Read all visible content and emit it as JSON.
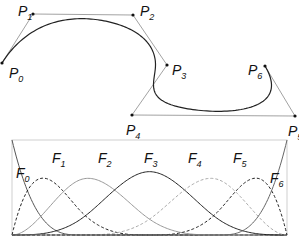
{
  "control_points": [
    {
      "name": "P",
      "index": "0",
      "x": 2,
      "y": 63,
      "lx": 9,
      "ly": 78
    },
    {
      "name": "P",
      "index": "1",
      "x": 33,
      "y": 14,
      "lx": 18,
      "ly": 16
    },
    {
      "name": "P",
      "index": "2",
      "x": 133,
      "y": 15,
      "lx": 140,
      "ly": 16
    },
    {
      "name": "P",
      "index": "3",
      "x": 167,
      "y": 65,
      "lx": 172,
      "ly": 75
    },
    {
      "name": "P",
      "index": "4",
      "x": 132,
      "y": 115,
      "lx": 126,
      "ly": 135
    },
    {
      "name": "P",
      "index": "5",
      "x": 295,
      "y": 116,
      "lx": 288,
      "ly": 136
    },
    {
      "name": "P",
      "index": "6",
      "x": 265,
      "y": 66,
      "lx": 248,
      "ly": 75
    }
  ],
  "basis_functions": [
    {
      "name": "F",
      "index": "0",
      "lx": 16,
      "ly": 178
    },
    {
      "name": "F",
      "index": "1",
      "lx": 52,
      "ly": 163
    },
    {
      "name": "F",
      "index": "2",
      "lx": 98,
      "ly": 163
    },
    {
      "name": "F",
      "index": "3",
      "lx": 144,
      "ly": 163
    },
    {
      "name": "F",
      "index": "4",
      "lx": 188,
      "ly": 163
    },
    {
      "name": "F",
      "index": "5",
      "lx": 233,
      "ly": 163
    },
    {
      "name": "F",
      "index": "6",
      "lx": 270,
      "ly": 183
    }
  ],
  "colors": {
    "curve": "#222222",
    "polygon": "#888888",
    "frame": "#cccccc"
  }
}
